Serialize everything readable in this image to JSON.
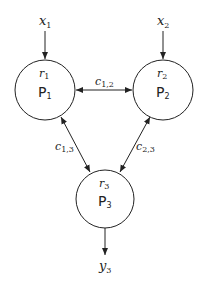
{
  "diagram": {
    "nodes": [
      {
        "id": "P1",
        "label": "P",
        "label_sub": "1",
        "rate": "r",
        "rate_sub": "1",
        "cx": 45,
        "cy": 90,
        "r": 30
      },
      {
        "id": "P2",
        "label": "P",
        "label_sub": "2",
        "rate": "r",
        "rate_sub": "2",
        "cx": 163,
        "cy": 90,
        "r": 30
      },
      {
        "id": "P3",
        "label": "P",
        "label_sub": "3",
        "rate": "r",
        "rate_sub": "3",
        "cx": 105,
        "cy": 199,
        "r": 30
      }
    ],
    "inputs": [
      {
        "label": "x",
        "sub": "1",
        "target": "P1"
      },
      {
        "label": "x",
        "sub": "2",
        "target": "P2"
      }
    ],
    "outputs": [
      {
        "label": "y",
        "sub": "3",
        "source": "P3"
      }
    ],
    "edges": [
      {
        "label": "c",
        "sub": "1,2",
        "from": "P1",
        "to": "P2",
        "bidirectional": true
      },
      {
        "label": "c",
        "sub": "1,3",
        "from": "P1",
        "to": "P3",
        "bidirectional": true
      },
      {
        "label": "c",
        "sub": "2,3",
        "from": "P2",
        "to": "P3",
        "bidirectional": true
      }
    ]
  }
}
